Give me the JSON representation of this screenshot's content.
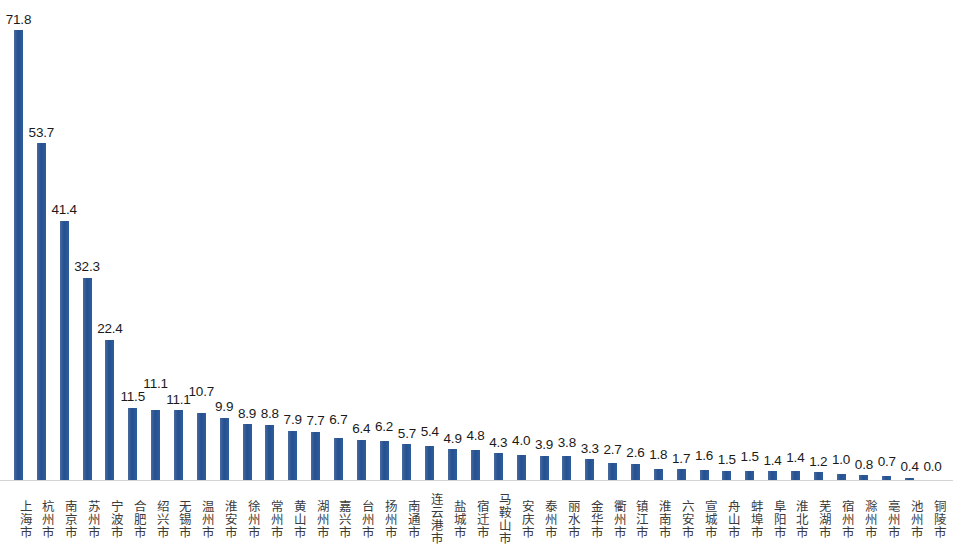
{
  "chart_data": {
    "type": "bar",
    "title": "",
    "subtitle": "",
    "xlabel": "",
    "ylabel": "",
    "ylim": [
      0,
      75
    ],
    "grid": false,
    "legend": null,
    "bar_color": "#2e5b9c",
    "label_color": "#1a1a1a",
    "axis_color": "#d4d4d4",
    "value_label_format": "one-decimal",
    "categories": [
      "上海市",
      "杭州市",
      "南京市",
      "苏州市",
      "宁波市",
      "合肥市",
      "绍兴市",
      "无锡市",
      "温州市",
      "淮安市",
      "徐州市",
      "常州市",
      "黄山市",
      "湖州市",
      "嘉兴市",
      "台州市",
      "扬州市",
      "南通市",
      "连云港市",
      "盐城市",
      "宿迁市",
      "马鞍山市",
      "安庆市",
      "泰州市",
      "丽水市",
      "金华市",
      "衢州市",
      "镇江市",
      "淮南市",
      "六安市",
      "宣城市",
      "舟山市",
      "蚌埠市",
      "阜阳市",
      "淮北市",
      "芜湖市",
      "宿州市",
      "滁州市",
      "亳州市",
      "池州市",
      "铜陵市"
    ],
    "values": [
      71.8,
      53.7,
      41.4,
      32.3,
      22.4,
      11.5,
      11.1,
      11.1,
      10.7,
      9.9,
      8.9,
      8.8,
      7.9,
      7.7,
      6.7,
      6.4,
      6.2,
      5.7,
      5.4,
      4.9,
      4.8,
      4.3,
      4.0,
      3.9,
      3.8,
      3.3,
      2.7,
      2.6,
      1.8,
      1.7,
      1.6,
      1.5,
      1.5,
      1.4,
      1.4,
      1.2,
      1.0,
      0.8,
      0.7,
      0.4,
      0.0
    ],
    "value_labels": [
      "71.8",
      "53.7",
      "41.4",
      "32.3",
      "22.4",
      "11.5",
      "11.1",
      "11.1",
      "10.7",
      "9.9",
      "8.9",
      "8.8",
      "7.9",
      "7.7",
      "6.7",
      "6.4",
      "6.2",
      "5.7",
      "5.4",
      "4.9",
      "4.8",
      "4.3",
      "4.0",
      "3.9",
      "3.8",
      "3.3",
      "2.7",
      "2.6",
      "1.8",
      "1.7",
      "1.6",
      "1.5",
      "1.5",
      "1.4",
      "1.4",
      "1.2",
      "1.0",
      "0.8",
      "0.7",
      "0.4",
      "0.0"
    ]
  }
}
